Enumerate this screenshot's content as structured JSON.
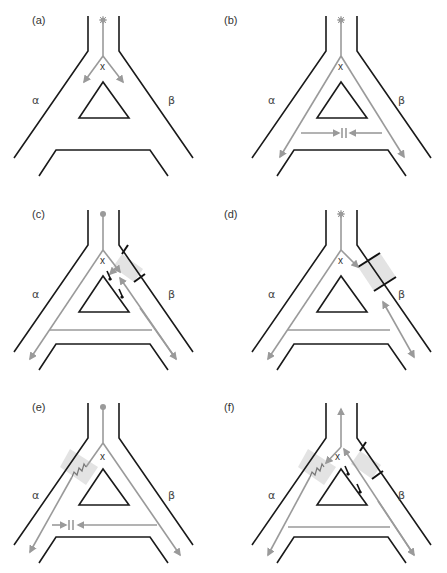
{
  "figure": {
    "type": "schematic flow diagram of a branching channel network",
    "colors": {
      "wall": "#1a1a1a",
      "flow": "#9a9a9a",
      "block_fill": "#e3e3e3",
      "block_edge": "#111111"
    },
    "panels": [
      {
        "id": "a",
        "label": "(a)",
        "node_label": "x",
        "left_branch": "α",
        "right_branch": "β",
        "description": "Source at top splits at node x into both branches α and β"
      },
      {
        "id": "b",
        "label": "(b)",
        "node_label": "x",
        "left_branch": "α",
        "right_branch": "β",
        "description": "Flow travels down both branches; lateral flows from α and β meet at a barrier on the cross channel"
      },
      {
        "id": "c",
        "label": "(c)",
        "node_label": "x",
        "left_branch": "α",
        "right_branch": "β",
        "description": "Partial block in branch β with small valves along inner wall; bidirectional flow in β"
      },
      {
        "id": "d",
        "label": "(d)",
        "node_label": "x",
        "left_branch": "α",
        "right_branch": "β",
        "description": "Full block across branch β; flow from x stops at block, flow in lower β is bidirectional"
      },
      {
        "id": "e",
        "label": "(e)",
        "node_label": "x",
        "left_branch": "α",
        "right_branch": "β",
        "description": "Resistive segment in branch α; cross channel flows meet at barrier near α"
      },
      {
        "id": "f",
        "label": "(f)",
        "node_label": "x",
        "left_branch": "α",
        "right_branch": "β",
        "description": "Resistor in α and block in β; flow reverses upward out of source channel"
      }
    ]
  }
}
